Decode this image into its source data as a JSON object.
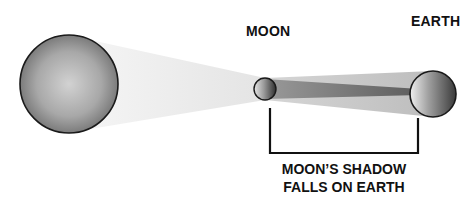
{
  "diagram": {
    "type": "solar-eclipse",
    "labels": {
      "moon": "MOON",
      "earth": "EARTH"
    },
    "caption": {
      "line1": "MOON’S SHADOW",
      "line2": "FALLS ON EARTH"
    },
    "bodies": [
      {
        "name": "sun",
        "cx": 69,
        "cy": 84,
        "r": 49
      },
      {
        "name": "moon",
        "cx": 265,
        "cy": 89,
        "r": 11
      },
      {
        "name": "earth",
        "cx": 433,
        "cy": 94,
        "r": 23
      }
    ],
    "colors": {
      "outline": "#1a1a1a",
      "sunlight": "#efefef",
      "penumbra": "#c4c4c4",
      "umbra": "#7a7a7a",
      "text": "#111111"
    }
  }
}
